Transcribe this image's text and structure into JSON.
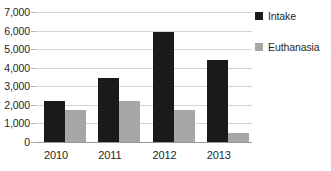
{
  "chart_data": {
    "type": "bar",
    "title": "",
    "xlabel": "",
    "ylabel": "",
    "categories": [
      "2010",
      "2011",
      "2012",
      "2013"
    ],
    "series": [
      {
        "name": "Intake",
        "color": "#1a1a1a",
        "values": [
          2200,
          3450,
          5900,
          4400
        ]
      },
      {
        "name": "Euthanasia",
        "color": "#a6a6a6",
        "values": [
          1750,
          2200,
          1700,
          500
        ]
      }
    ],
    "ylim": [
      0,
      7000
    ],
    "ytick_step": 1000,
    "ytick_labels": [
      "7,000",
      "6,000",
      "5,000",
      "4,000",
      "3,000",
      "2,000",
      "1,000",
      "0"
    ],
    "ytick_values": [
      7000,
      6000,
      5000,
      4000,
      3000,
      2000,
      1000,
      0
    ],
    "grid": true,
    "grid_axis": "y",
    "legend_position": "right"
  }
}
